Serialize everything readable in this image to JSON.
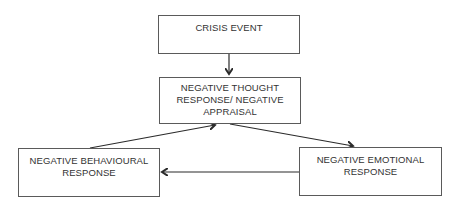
{
  "diagram": {
    "nodes": [
      {
        "id": "crisis-event",
        "lines": [
          "CRISIS EVENT"
        ]
      },
      {
        "id": "negative-thought",
        "lines": [
          "NEGATIVE THOUGHT",
          "RESPONSE/ NEGATIVE",
          "APPRAISAL"
        ]
      },
      {
        "id": "negative-behavioural",
        "lines": [
          "NEGATIVE BEHAVIOURAL",
          "RESPONSE"
        ]
      },
      {
        "id": "negative-emotional",
        "lines": [
          "NEGATIVE EMOTIONAL",
          "RESPONSE"
        ]
      }
    ],
    "edges": [
      {
        "from": "crisis-event",
        "to": "negative-thought"
      },
      {
        "from": "negative-thought",
        "to": "negative-emotional"
      },
      {
        "from": "negative-emotional",
        "to": "negative-behavioural"
      },
      {
        "from": "negative-behavioural",
        "to": "negative-thought"
      }
    ],
    "colors": {
      "border": "#5a5a5a",
      "arrow": "#2b2b2b",
      "text": "#333333",
      "background": "#ffffff"
    }
  }
}
